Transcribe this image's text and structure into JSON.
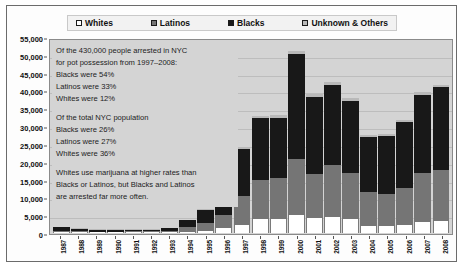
{
  "chart_data": {
    "type": "bar",
    "subtype": "stacked-bar",
    "title": "",
    "xlabel": "",
    "ylabel": "",
    "ylim": [
      0,
      55000
    ],
    "ytick_step": 5000,
    "ytick_labels": [
      "55,000",
      "50,000",
      "45,000",
      "40,000",
      "35,000",
      "30,000",
      "25,000",
      "20,000",
      "15,000",
      "10,000",
      "5,000",
      "0"
    ],
    "grid": true,
    "legend_position": "top",
    "categories": [
      "1987",
      "1988",
      "1989",
      "1990",
      "1991",
      "1992",
      "1993",
      "1994",
      "1995",
      "1996",
      "1997",
      "1998",
      "1999",
      "2000",
      "2001",
      "2002",
      "2003",
      "2004",
      "2005",
      "2006",
      "2007",
      "2008"
    ],
    "series": [
      {
        "name": "Whites",
        "color": "#ffffff",
        "values": [
          200,
          180,
          160,
          160,
          170,
          170,
          200,
          400,
          700,
          1400,
          2400,
          4000,
          4100,
          5000,
          4300,
          4600,
          4100,
          2100,
          2100,
          2400,
          3100,
          3300
        ]
      },
      {
        "name": "Latinos",
        "color": "#757575",
        "values": [
          500,
          350,
          250,
          250,
          300,
          300,
          400,
          1200,
          2200,
          3600,
          8200,
          11000,
          11500,
          16000,
          12300,
          14800,
          12800,
          9500,
          9000,
          10500,
          14000,
          14500
        ]
      },
      {
        "name": "Blacks",
        "color": "#181818",
        "values": [
          900,
          700,
          450,
          450,
          500,
          500,
          700,
          2000,
          3600,
          6400,
          13200,
          17500,
          17000,
          29800,
          22000,
          22500,
          20500,
          15500,
          16500,
          18500,
          22000,
          23500
        ]
      },
      {
        "name": "Unknown & Others",
        "color": "#b9b9b9",
        "values": [
          100,
          100,
          80,
          80,
          80,
          80,
          100,
          200,
          300,
          500,
          700,
          800,
          800,
          900,
          900,
          900,
          800,
          600,
          600,
          700,
          800,
          800
        ]
      }
    ],
    "totals": [
      1700,
      1330,
      940,
      940,
      1050,
      1050,
      1400,
      3800,
      6800,
      11900,
      24500,
      33300,
      33400,
      51700,
      39500,
      42800,
      38200,
      27700,
      28200,
      32100,
      39900,
      42100
    ],
    "annotations": [
      "Of the 430,000 people arrested in NYC",
      "for pot possession from 1997–2008:",
      "Blacks were 54%",
      "Latinos were 33%",
      "Whites were 12%",
      "",
      "Of the total NYC population",
      "Blacks were 26%",
      "Latinos were 27%",
      "Whites were 36%",
      "",
      "Whites use marijuana at higher rates than",
      "Blacks or Latinos, but Blacks and Latinos",
      "are arrested far more often."
    ]
  },
  "legend": {
    "items": [
      {
        "label": "Whites",
        "swatch_color": "#ffffff"
      },
      {
        "label": "Latinos",
        "swatch_color": "#757575"
      },
      {
        "label": "Blacks",
        "swatch_color": "#181818"
      },
      {
        "label": "Unknown & Others",
        "swatch_color": "#b9b9b9"
      }
    ]
  },
  "colors": {
    "plot_background": "#d4d4d4",
    "figure_background": "#fdfdfd",
    "gridline": "#bdbdbd",
    "axis": "#555555",
    "text": "#111111"
  }
}
